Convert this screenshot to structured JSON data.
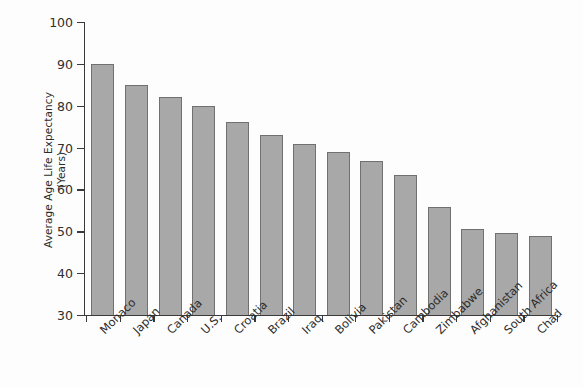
{
  "chart_data": {
    "type": "bar",
    "title": "",
    "xlabel": "",
    "ylabel": "Average Age Life Expectancy (Years)",
    "ylabel_line1": "Average Age Life Expectancy",
    "ylabel_line2": "(Years)",
    "ylim": [
      30,
      100
    ],
    "yticks": [
      30,
      40,
      50,
      60,
      70,
      80,
      90,
      100
    ],
    "ytick_labels": [
      "30",
      "40",
      "50",
      "60",
      "70",
      "80",
      "90",
      "100"
    ],
    "grid": false,
    "legend": false,
    "bar_color": "#a8a8a8",
    "bar_edge_color": "#70706f",
    "axis_color": "#3a3a3a",
    "background_color": "#fdfdfd",
    "categories": [
      "Monaco",
      "Japan",
      "Canada",
      "U.S.",
      "Croatia",
      "Brazil",
      "Iraq",
      "Bolivia",
      "Pakistan",
      "Cambodia",
      "Zimbabwe",
      "Afghanistan",
      "South Africa",
      "Chad"
    ],
    "values": [
      90,
      85,
      82,
      80,
      76,
      73,
      70.8,
      69,
      66.8,
      63.5,
      55.8,
      50.6,
      49.6,
      48.8
    ]
  }
}
